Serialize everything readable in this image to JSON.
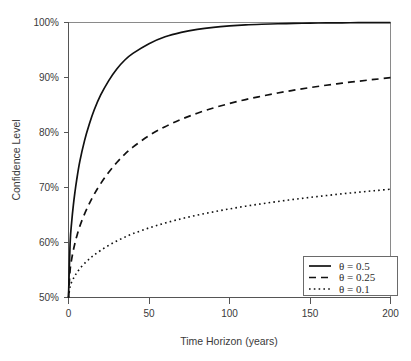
{
  "chart_data": {
    "type": "line",
    "title": "",
    "xlabel": "Time Horizon (years)",
    "ylabel": "Confidence Level",
    "xlim": [
      0,
      200
    ],
    "ylim": [
      0.5,
      1.0
    ],
    "xticks": [
      0,
      50,
      100,
      150,
      200
    ],
    "xtick_labels": [
      "0",
      "50",
      "100",
      "150",
      "200"
    ],
    "yticks": [
      0.5,
      0.6,
      0.7,
      0.8,
      0.9,
      1.0
    ],
    "ytick_labels": [
      "50%",
      "60%",
      "70%",
      "80%",
      "90%",
      "100%"
    ],
    "grid": false,
    "legend_position": "lower right",
    "series": [
      {
        "name": "theta-0-5",
        "label": "θ = 0.5",
        "theta_symbol": "θ",
        "theta_relation": "=",
        "theta_value": "0.5",
        "style": "solid",
        "color": "#111111",
        "x": [
          0,
          1,
          2,
          3,
          4,
          5,
          7,
          10,
          13,
          16,
          20,
          25,
          30,
          35,
          40,
          50,
          60,
          70,
          80,
          90,
          100,
          110,
          120,
          130,
          140,
          150,
          160,
          170,
          180,
          190,
          200
        ],
        "y": [
          0.5,
          0.5987,
          0.6382,
          0.6675,
          0.6915,
          0.7122,
          0.747,
          0.7857,
          0.8159,
          0.8413,
          0.8682,
          0.8944,
          0.9154,
          0.9318,
          0.9438,
          0.9615,
          0.974,
          0.9821,
          0.9876,
          0.9913,
          0.9938,
          0.9956,
          0.9968,
          0.9977,
          0.9984,
          0.9989,
          0.9992,
          0.9994,
          0.9996,
          0.9997,
          0.9998
        ]
      },
      {
        "name": "theta-0-25",
        "label": "θ = 0.25",
        "theta_symbol": "θ",
        "theta_relation": "=",
        "theta_value": "0.25",
        "style": "dashed",
        "color": "#111111",
        "x": [
          0,
          1,
          2,
          3,
          4,
          5,
          7,
          10,
          13,
          16,
          20,
          25,
          30,
          35,
          40,
          50,
          60,
          70,
          80,
          90,
          100,
          110,
          120,
          130,
          140,
          150,
          160,
          170,
          180,
          190,
          200
        ],
        "y": [
          0.5,
          0.5497,
          0.5702,
          0.5857,
          0.5987,
          0.6099,
          0.6293,
          0.6521,
          0.6711,
          0.6879,
          0.7071,
          0.7278,
          0.7454,
          0.7606,
          0.7734,
          0.7943,
          0.8106,
          0.8239,
          0.8351,
          0.8446,
          0.8527,
          0.8599,
          0.8661,
          0.8718,
          0.877,
          0.8817,
          0.8859,
          0.8897,
          0.8932,
          0.8965,
          0.8996
        ]
      },
      {
        "name": "theta-0-1",
        "label": "θ = 0.1",
        "theta_symbol": "θ",
        "theta_relation": "=",
        "theta_value": "0.1",
        "style": "dotted",
        "color": "#111111",
        "x": [
          0,
          1,
          2,
          3,
          4,
          5,
          7,
          10,
          13,
          16,
          20,
          25,
          30,
          35,
          40,
          50,
          60,
          70,
          80,
          90,
          100,
          110,
          120,
          130,
          140,
          150,
          160,
          170,
          180,
          190,
          200
        ],
        "y": [
          0.5,
          0.5199,
          0.5282,
          0.5345,
          0.5398,
          0.5444,
          0.5524,
          0.5621,
          0.5702,
          0.5774,
          0.5857,
          0.5949,
          0.6028,
          0.6098,
          0.616,
          0.6266,
          0.6354,
          0.6431,
          0.6498,
          0.6557,
          0.6611,
          0.666,
          0.6704,
          0.6746,
          0.6784,
          0.682,
          0.6853,
          0.6885,
          0.6914,
          0.6942,
          0.6969
        ]
      }
    ],
    "endpoint_values": {
      "theta-0-5": "100%",
      "theta-0-25": "96%",
      "theta-0-1": "76%"
    }
  }
}
